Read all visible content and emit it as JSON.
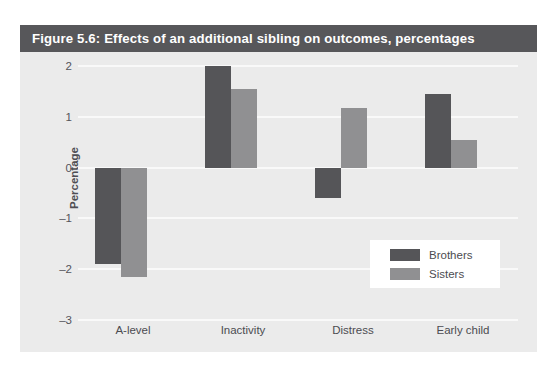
{
  "figure": {
    "title": "Figure 5.6: Effects of an additional sibling on outcomes, percentages",
    "title_band_color": "#57575a",
    "panel_color": "#ebebeb",
    "gridline_color": "#f9f9f9"
  },
  "chart_data": {
    "type": "bar",
    "title": "Figure 5.6: Effects of an additional sibling on outcomes, percentages",
    "xlabel": "",
    "ylabel": "Percentage",
    "categories": [
      "A-level",
      "Inactivity",
      "Distress",
      "Early child"
    ],
    "series": [
      {
        "name": "Brothers",
        "color": "#555558",
        "values": [
          -1.9,
          2.0,
          -0.6,
          1.45
        ]
      },
      {
        "name": "Sisters",
        "color": "#909092",
        "values": [
          -2.15,
          1.55,
          1.18,
          0.55
        ]
      }
    ],
    "ylim": [
      -3,
      2
    ],
    "yticks": [
      2,
      1,
      0,
      -1,
      -2,
      -3
    ],
    "ytick_labels": [
      "2",
      "1",
      "0",
      "–1",
      "–2",
      "–3"
    ],
    "grid": true,
    "legend_position": "bottom-right-inside"
  }
}
